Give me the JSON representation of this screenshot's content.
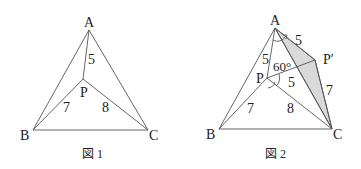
{
  "figures": [
    {
      "caption": "図 1",
      "points": {
        "A": {
          "label": "A",
          "x": 89,
          "y": 30
        },
        "B": {
          "label": "B",
          "x": 33,
          "y": 130
        },
        "C": {
          "label": "C",
          "x": 148,
          "y": 130
        },
        "P": {
          "label": "P",
          "x": 83,
          "y": 79
        }
      },
      "lengths": {
        "PA": "5",
        "PB": "7",
        "PC": "8"
      }
    },
    {
      "caption": "図 2",
      "points": {
        "A": {
          "label": "A",
          "x": 275,
          "y": 28
        },
        "B": {
          "label": "B",
          "x": 219,
          "y": 129
        },
        "C": {
          "label": "C",
          "x": 332,
          "y": 129
        },
        "P": {
          "label": "P",
          "x": 267,
          "y": 78
        },
        "P2": {
          "label": "P′",
          "x": 315,
          "y": 60
        }
      },
      "lengths": {
        "PA": "5",
        "AP2": "5",
        "PP2": "5",
        "PB": "7",
        "PC": "8",
        "P2C": "7"
      },
      "angle": "60°",
      "shade_color": "#d9d9d9"
    }
  ]
}
